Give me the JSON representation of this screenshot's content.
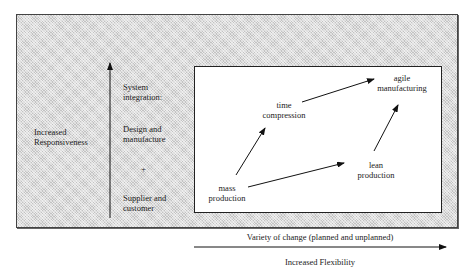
{
  "diagram": {
    "left_axis_label": [
      "Increased",
      "Responsiveness"
    ],
    "system_integration": {
      "heading": [
        "System",
        "integration:"
      ],
      "item1": [
        "Design and",
        "manufacture"
      ],
      "plus": "+",
      "item2": [
        "Supplier and",
        "customer"
      ]
    },
    "nodes": {
      "mass_production": [
        "mass",
        "production"
      ],
      "time_compression": [
        "time",
        "compression"
      ],
      "lean_production": [
        "lean",
        "production"
      ],
      "agile_manufacturing": [
        "agile",
        "manufacturing"
      ]
    },
    "edges": [
      {
        "from": "mass production",
        "to": "time compression"
      },
      {
        "from": "mass production",
        "to": "lean production"
      },
      {
        "from": "time compression",
        "to": "agile manufacturing"
      },
      {
        "from": "lean production",
        "to": "agile manufacturing"
      }
    ],
    "x_axis_caption": "Variety of change (planned and unplanned)",
    "x_axis_label": "Increased Flexibility",
    "colors": {
      "shaded_background": "#dcdcdc",
      "inner_box": "#ffffff",
      "lines": "#111111"
    }
  }
}
